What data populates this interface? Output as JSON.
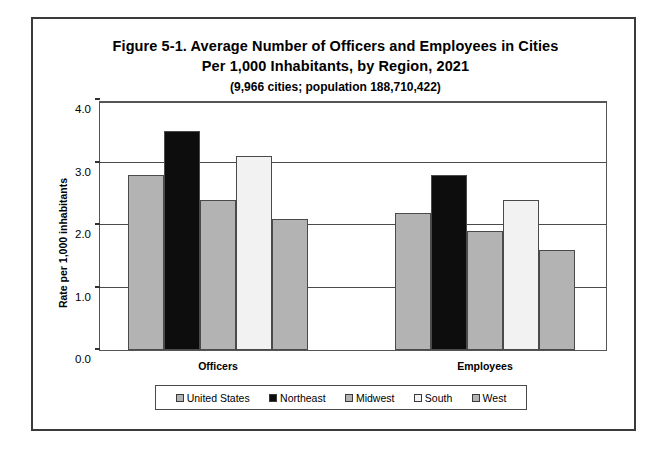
{
  "figure": {
    "title_line_1": "Figure 5-1. Average Number of Officers and Employees in Cities",
    "title_line_2": "Per 1,000 Inhabitants, by Region, 2021",
    "subtitle": "(9,966 cities; population 188,710,422)"
  },
  "chart_data": {
    "type": "bar",
    "title": "Figure 5-1. Average Number of Officers and Employees in Cities Per 1,000 Inhabitants, by Region, 2021",
    "subtitle": "(9,966 cities; population 188,710,422)",
    "xlabel": "",
    "ylabel": "Rate per 1,000 inhabitants",
    "ylim": [
      0.0,
      4.0
    ],
    "ytick_labels": [
      "0.0",
      "1.0",
      "2.0",
      "3.0",
      "4.0"
    ],
    "ytick_values": [
      0.0,
      1.0,
      2.0,
      3.0,
      4.0
    ],
    "grid": true,
    "legend_position": "bottom",
    "categories": [
      "Officers",
      "Employees"
    ],
    "series": [
      {
        "name": "United States",
        "values": [
          2.8,
          2.2
        ],
        "fill": "#b3b3b3"
      },
      {
        "name": "Northeast",
        "values": [
          3.5,
          2.8
        ],
        "fill": "#0d0d0d"
      },
      {
        "name": "Midwest",
        "values": [
          2.4,
          1.9
        ],
        "fill": "#b3b3b3"
      },
      {
        "name": "South",
        "values": [
          3.1,
          2.4
        ],
        "fill": "#f2f2f2"
      },
      {
        "name": "West",
        "values": [
          2.1,
          1.6
        ],
        "fill": "#b3b3b3"
      }
    ]
  }
}
